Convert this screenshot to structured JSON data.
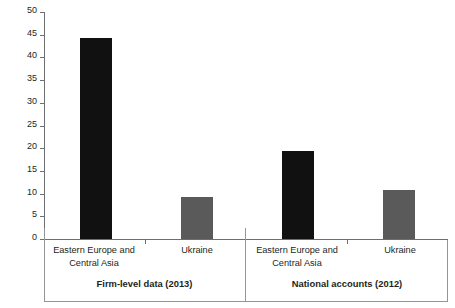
{
  "chart_data": {
    "type": "bar",
    "title": "",
    "xlabel": "",
    "ylabel": "Labor productivity (thousands of US$ per worker)",
    "ylim": [
      0,
      50
    ],
    "ytick_step": 5,
    "yticks": [
      "50",
      "45",
      "40",
      "35",
      "30",
      "25",
      "20",
      "15",
      "10",
      "5",
      "0"
    ],
    "grid": false,
    "legend": "none",
    "categories": [
      "Eastern Europe and Central Asia",
      "Ukraine",
      "Eastern Europe and Central Asia",
      "Ukraine"
    ],
    "values": [
      44.3,
      9.2,
      19.4,
      10.7
    ],
    "groups": [
      {
        "label": "Firm-level data (2013)",
        "bars": [
          {
            "category": "Eastern Europe and Central Asia",
            "line1": "Eastern Europe and",
            "line2": "Central Asia",
            "value": 44.3,
            "color": "#111111"
          },
          {
            "category": "Ukraine",
            "line1": "Ukraine",
            "line2": "",
            "value": 9.2,
            "color": "#5a5a5a"
          }
        ]
      },
      {
        "label": "National accounts (2012)",
        "bars": [
          {
            "category": "Eastern Europe and Central Asia",
            "line1": "Eastern Europe and",
            "line2": "Central Asia",
            "value": 19.4,
            "color": "#111111"
          },
          {
            "category": "Ukraine",
            "line1": "Ukraine",
            "line2": "",
            "value": 10.7,
            "color": "#5a5a5a"
          }
        ]
      }
    ],
    "colors": {
      "eastern_europe_central_asia": "#111111",
      "ukraine": "#5a5a5a",
      "axis": "#6d6e71",
      "rule": "#939598",
      "text": "#231f20",
      "background": "#ffffff"
    }
  }
}
